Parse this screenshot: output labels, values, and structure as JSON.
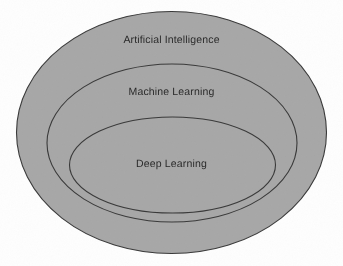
{
  "diagram": {
    "background_color": "#fefefe",
    "fill_color": "#a8a8a8",
    "stroke_color": "#3a3a3a",
    "text_color": "#2a2a2a"
  },
  "chart_data": {
    "type": "diagram",
    "subtype": "nested-ellipse-venn",
    "title": "",
    "levels": [
      {
        "label": "Artificial Intelligence",
        "depth": 1,
        "cx": 171.5,
        "cy": 132.5,
        "rx": 155,
        "ry": 121,
        "fill": "#a8a8a8",
        "stroke": "#3a3a3a",
        "label_x": 171.5,
        "label_y": 41
      },
      {
        "label": "Machine Learning",
        "depth": 2,
        "cx": 172,
        "cy": 143,
        "rx": 125,
        "ry": 79,
        "fill": "none",
        "stroke": "#3a3a3a",
        "label_x": 172,
        "label_y": 93
      },
      {
        "label": "Deep Learning",
        "depth": 3,
        "cx": 172.5,
        "cy": 165,
        "rx": 103,
        "ry": 48,
        "fill": "none",
        "stroke": "#3a3a3a",
        "label_x": 172.5,
        "label_y": 165
      }
    ],
    "relationship": "Deep Learning is a subset of Machine Learning, which is a subset of Artificial Intelligence",
    "legend": [],
    "grid": false
  },
  "labels": {
    "outer": "Artificial Intelligence",
    "middle": "Machine Learning",
    "inner": "Deep Learning"
  }
}
